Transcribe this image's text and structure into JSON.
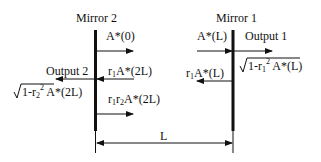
{
  "mirrors": [
    {
      "label": "Mirror 2",
      "position": "left"
    },
    {
      "label": "Mirror 1",
      "position": "right"
    }
  ],
  "beams": {
    "a0": "A*(0)",
    "aL": "A*(L)",
    "output1": "Output 1",
    "r1aL": "A*(L)",
    "r1aL_prefix": "r",
    "r1aL_sub": "1",
    "sqrt1_term": "1-r",
    "sqrt1_sub": "1",
    "sqrt1_sup": "2",
    "sqrt1_tail": " A*(L)",
    "output2": "Output 2",
    "r1a2L_prefix": "r",
    "r1a2L_sub": "1",
    "r1a2L": "A*(2L)",
    "sqrt2_term": "1-r",
    "sqrt2_sub": "2",
    "sqrt2_sup": "2",
    "sqrt2_tail": " A*(2L)",
    "r1r2_prefix": "r",
    "r1r2_sub1": "1",
    "r1r2_mid": "r",
    "r1r2_sub2": "2",
    "r1r2a2L": "A*(2L)"
  },
  "dimension": {
    "label": "L"
  },
  "colors": {
    "line": "#111111",
    "background": "#ffffff"
  }
}
